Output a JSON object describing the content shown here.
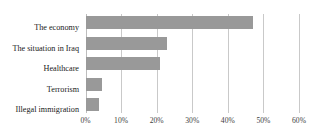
{
  "chart_data": {
    "type": "bar",
    "orientation": "horizontal",
    "title": "",
    "subtitle": "",
    "xlabel": "",
    "ylabel": "",
    "categories": [
      "The economy",
      "The situation in Iraq",
      "Healthcare",
      "Terrorism",
      "Illegal immigration"
    ],
    "values": [
      47,
      23,
      21,
      4.6,
      3.8
    ],
    "value_suffix": "%",
    "xlim": [
      0,
      60
    ],
    "xticks": [
      0,
      10,
      20,
      30,
      40,
      50,
      60
    ],
    "xtick_labels": [
      "0%",
      "10%",
      "20%",
      "30%",
      "40%",
      "50%",
      "60%"
    ],
    "grid": "vertical",
    "legend": "none",
    "bar_color": "#999999",
    "gridline_color": "#c9c9c9",
    "background_color": "#ffffff",
    "text_color": "#1a1a1a"
  }
}
